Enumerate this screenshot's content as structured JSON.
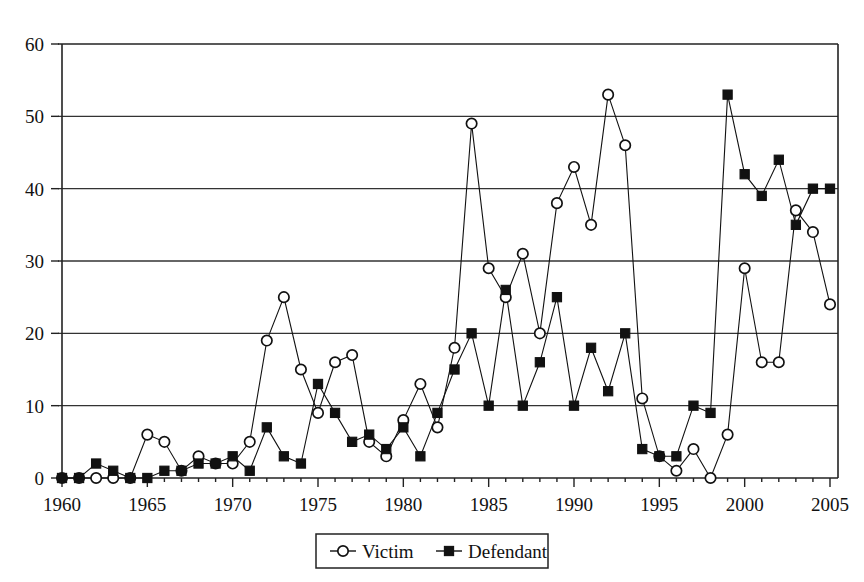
{
  "chart_data": {
    "type": "line",
    "title": "",
    "subtitle": "",
    "xlabel": "",
    "ylabel": "",
    "xlim": [
      1960,
      2005
    ],
    "ylim": [
      0,
      60
    ],
    "ytick_step": 10,
    "xtick_step": 5,
    "grid": "horizontal",
    "legend_position": "bottom-center",
    "x": [
      1960,
      1961,
      1962,
      1963,
      1964,
      1965,
      1966,
      1967,
      1968,
      1969,
      1970,
      1971,
      1972,
      1973,
      1974,
      1975,
      1976,
      1977,
      1978,
      1979,
      1980,
      1981,
      1982,
      1983,
      1984,
      1985,
      1986,
      1987,
      1988,
      1989,
      1990,
      1991,
      1992,
      1993,
      1994,
      1995,
      1996,
      1997,
      1998,
      1999,
      2000,
      2001,
      2002,
      2003,
      2004,
      2005
    ],
    "xticks": [
      1960,
      1965,
      1970,
      1975,
      1980,
      1985,
      1990,
      1995,
      2000,
      2005
    ],
    "xtick_labels": [
      "1960",
      "1965",
      "1970",
      "1975",
      "1980",
      "1985",
      "1990",
      "1995",
      "2000",
      "2005"
    ],
    "yticks": [
      0,
      10,
      20,
      30,
      40,
      50,
      60
    ],
    "ytick_labels": [
      "0",
      "10",
      "20",
      "30",
      "40",
      "50",
      "60"
    ],
    "series": [
      {
        "name": "Victim",
        "marker": "open-circle",
        "values": [
          0,
          0,
          0,
          0,
          0,
          6,
          5,
          1,
          3,
          2,
          2,
          5,
          19,
          25,
          15,
          9,
          16,
          17,
          5,
          3,
          8,
          13,
          7,
          18,
          49,
          29,
          25,
          31,
          20,
          38,
          43,
          35,
          53,
          46,
          11,
          3,
          1,
          4,
          0,
          6,
          29,
          16,
          16,
          37,
          34,
          24
        ]
      },
      {
        "name": "Defendant",
        "marker": "filled-square",
        "values": [
          0,
          0,
          2,
          1,
          0,
          0,
          1,
          1,
          2,
          2,
          3,
          1,
          7,
          3,
          2,
          13,
          9,
          5,
          6,
          4,
          7,
          3,
          9,
          15,
          20,
          10,
          26,
          10,
          16,
          25,
          10,
          18,
          12,
          20,
          4,
          3,
          3,
          10,
          9,
          53,
          42,
          39,
          44,
          35,
          40,
          40
        ]
      }
    ]
  },
  "legend": {
    "items": [
      {
        "label": "Victim",
        "marker": "open-circle"
      },
      {
        "label": "Defendant",
        "marker": "filled-square"
      }
    ]
  },
  "colors": {
    "ink": "#111111",
    "axis": "#222222",
    "grid": "#333333",
    "background": "#ffffff",
    "marker_fill_open": "#ffffff",
    "marker_fill_closed": "#111111"
  }
}
